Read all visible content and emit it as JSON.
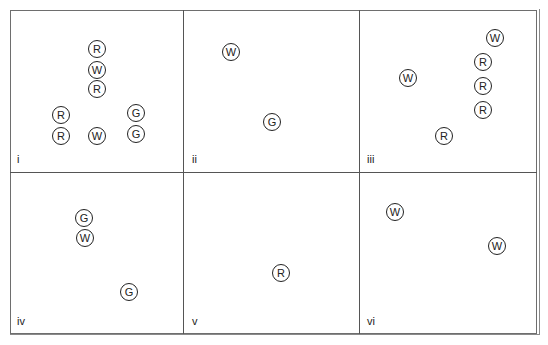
{
  "diagram": {
    "panels": [
      {
        "label": "i",
        "label_pos": [
          17,
          162
        ],
        "tokens": [
          {
            "letter": "R",
            "x": 97,
            "y": 49
          },
          {
            "letter": "W",
            "x": 97,
            "y": 70
          },
          {
            "letter": "R",
            "x": 97,
            "y": 89
          },
          {
            "letter": "R",
            "x": 61,
            "y": 115
          },
          {
            "letter": "R",
            "x": 61,
            "y": 136
          },
          {
            "letter": "W",
            "x": 97,
            "y": 136
          },
          {
            "letter": "G",
            "x": 136,
            "y": 113
          },
          {
            "letter": "G",
            "x": 136,
            "y": 134
          }
        ]
      },
      {
        "label": "ii",
        "label_pos": [
          192,
          162
        ],
        "tokens": [
          {
            "letter": "W",
            "x": 231,
            "y": 52
          },
          {
            "letter": "G",
            "x": 272,
            "y": 122
          }
        ]
      },
      {
        "label": "iii",
        "label_pos": [
          367,
          162
        ],
        "tokens": [
          {
            "letter": "W",
            "x": 495,
            "y": 38
          },
          {
            "letter": "R",
            "x": 483,
            "y": 62
          },
          {
            "letter": "W",
            "x": 408,
            "y": 78
          },
          {
            "letter": "R",
            "x": 483,
            "y": 86
          },
          {
            "letter": "R",
            "x": 483,
            "y": 110
          },
          {
            "letter": "R",
            "x": 444,
            "y": 136
          }
        ]
      },
      {
        "label": "iv",
        "label_pos": [
          17,
          324
        ],
        "tokens": [
          {
            "letter": "G",
            "x": 84,
            "y": 218
          },
          {
            "letter": "W",
            "x": 85,
            "y": 238
          },
          {
            "letter": "G",
            "x": 129,
            "y": 292
          }
        ]
      },
      {
        "label": "v",
        "label_pos": [
          192,
          324
        ],
        "tokens": [
          {
            "letter": "R",
            "x": 281,
            "y": 273
          }
        ]
      },
      {
        "label": "vi",
        "label_pos": [
          367,
          324
        ],
        "tokens": [
          {
            "letter": "W",
            "x": 395,
            "y": 212
          },
          {
            "letter": "W",
            "x": 497,
            "y": 246
          }
        ]
      }
    ],
    "dividers": {
      "vertical_x": [
        183,
        359
      ],
      "horizontal_y": [
        172
      ]
    }
  }
}
